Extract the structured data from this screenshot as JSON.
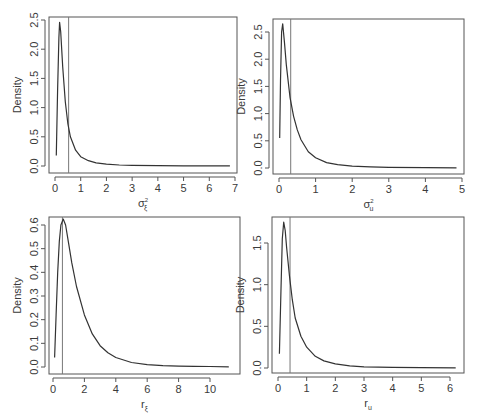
{
  "chart_data": [
    {
      "type": "line",
      "title": "",
      "xlabel": "σ_ξ²",
      "xlabel_main": "σ",
      "xlabel_sup": "2",
      "xlabel_sub": "ξ",
      "ylabel": "Density",
      "xlim": [
        0,
        7
      ],
      "ylim": [
        0,
        2.5
      ],
      "xticks": [
        0,
        1,
        2,
        3,
        4,
        5,
        6,
        7
      ],
      "yticks": [
        "0.0",
        "0.5",
        "1.0",
        "1.5",
        "2.0",
        "2.5"
      ],
      "vline": 0.53,
      "grid": false,
      "x": [
        0.05,
        0.1,
        0.15,
        0.18,
        0.22,
        0.3,
        0.4,
        0.5,
        0.6,
        0.8,
        1.0,
        1.3,
        1.6,
        2.0,
        2.5,
        3.0,
        4.0,
        5.0,
        6.0,
        6.8
      ],
      "y": [
        0.18,
        1.3,
        2.2,
        2.46,
        2.3,
        1.7,
        1.1,
        0.72,
        0.5,
        0.27,
        0.16,
        0.09,
        0.055,
        0.03,
        0.017,
        0.01,
        0.005,
        0.003,
        0.002,
        0.001
      ]
    },
    {
      "type": "line",
      "title": "",
      "xlabel": "σ_u²",
      "xlabel_main": "σ",
      "xlabel_sup": "2",
      "xlabel_sub": "u",
      "ylabel": "Density",
      "xlim": [
        0,
        5
      ],
      "ylim": [
        0,
        2.5
      ],
      "xticks": [
        0,
        1,
        2,
        3,
        4,
        5
      ],
      "yticks": [
        "0.0",
        "0.5",
        "1.0",
        "1.5",
        "2.0",
        "2.5"
      ],
      "vline": 0.32,
      "grid": false,
      "x": [
        0.02,
        0.04,
        0.07,
        0.1,
        0.15,
        0.2,
        0.3,
        0.4,
        0.5,
        0.6,
        0.8,
        1.0,
        1.3,
        1.6,
        2.0,
        2.5,
        3.0,
        4.0,
        4.85
      ],
      "y": [
        0.55,
        1.6,
        2.5,
        2.65,
        2.3,
        1.9,
        1.3,
        0.95,
        0.7,
        0.52,
        0.3,
        0.19,
        0.1,
        0.06,
        0.035,
        0.02,
        0.012,
        0.005,
        0.003
      ]
    },
    {
      "type": "line",
      "title": "",
      "xlabel": "r_ξ",
      "xlabel_main": "r",
      "xlabel_sup": "",
      "xlabel_sub": "ξ",
      "ylabel": "Density",
      "xlim": [
        0,
        11
      ],
      "ylim": [
        0,
        0.6
      ],
      "xticks": [
        0,
        2,
        4,
        6,
        8,
        10
      ],
      "yticks": [
        "0.0",
        "0.1",
        "0.2",
        "0.3",
        "0.4",
        "0.5",
        "0.6"
      ],
      "vline": 0.6,
      "grid": false,
      "x": [
        0.1,
        0.2,
        0.3,
        0.4,
        0.5,
        0.65,
        0.8,
        1.0,
        1.2,
        1.5,
        2.0,
        2.5,
        3.0,
        3.5,
        4.0,
        5.0,
        6.0,
        7.0,
        8.0,
        9.0,
        10.0,
        11.2
      ],
      "y": [
        0.04,
        0.22,
        0.4,
        0.53,
        0.6,
        0.625,
        0.6,
        0.52,
        0.44,
        0.34,
        0.22,
        0.14,
        0.09,
        0.06,
        0.04,
        0.019,
        0.01,
        0.006,
        0.004,
        0.003,
        0.002,
        0.001
      ]
    },
    {
      "type": "line",
      "title": "",
      "xlabel": "r_u",
      "xlabel_main": "r",
      "xlabel_sup": "",
      "xlabel_sub": "u",
      "ylabel": "Density",
      "xlim": [
        0,
        6
      ],
      "ylim": [
        0,
        1.5
      ],
      "xticks": [
        0,
        1,
        2,
        3,
        4,
        5,
        6
      ],
      "yticks": [
        "0.0",
        "0.5",
        "1.0",
        "1.5"
      ],
      "vline": 0.42,
      "grid": false,
      "x": [
        0.05,
        0.1,
        0.15,
        0.2,
        0.25,
        0.3,
        0.4,
        0.5,
        0.6,
        0.8,
        1.0,
        1.3,
        1.6,
        2.0,
        2.5,
        3.0,
        4.0,
        5.0,
        6.2
      ],
      "y": [
        0.17,
        0.9,
        1.55,
        1.75,
        1.65,
        1.45,
        1.1,
        0.82,
        0.6,
        0.38,
        0.25,
        0.14,
        0.085,
        0.05,
        0.025,
        0.015,
        0.007,
        0.004,
        0.002
      ]
    }
  ],
  "layout": {
    "panels": [
      {
        "left": 49,
        "right": 237,
        "top": 17,
        "bottom": 173,
        "x0px": 55,
        "x1px": 235,
        "y0px": 166,
        "y1px": 20
      },
      {
        "left": 273,
        "right": 464,
        "top": 19,
        "bottom": 174,
        "x0px": 279,
        "x1px": 462,
        "y0px": 168,
        "y1px": 32
      },
      {
        "left": 49,
        "right": 240,
        "top": 217,
        "bottom": 374,
        "x0px": 53,
        "x1px": 210,
        "y0px": 367,
        "y1px": 225
      },
      {
        "left": 272,
        "right": 464,
        "top": 217,
        "bottom": 373,
        "x0px": 278,
        "x1px": 450,
        "y0px": 368,
        "y1px": 243
      }
    ]
  }
}
